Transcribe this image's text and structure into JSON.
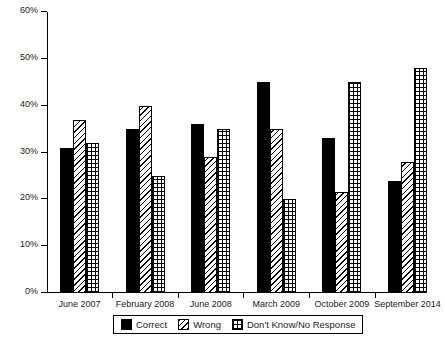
{
  "chart_data": {
    "type": "bar",
    "title": "",
    "subtitle": "",
    "xlabel": "",
    "ylabel": "",
    "ylim": [
      0,
      60
    ],
    "ytick_values": [
      0,
      10,
      20,
      30,
      40,
      50,
      60
    ],
    "ytick_labels": [
      "0%",
      "10%",
      "20%",
      "30%",
      "40%",
      "50%",
      "60%"
    ],
    "grid": false,
    "legend_position": "bottom",
    "categories": [
      "June 2007",
      "February 2008",
      "June 2008",
      "March 2009",
      "October 2009",
      "September 2014"
    ],
    "series": [
      {
        "name": "Correct",
        "pattern": "solid-black",
        "color": "#000000",
        "values": [
          31,
          35,
          36,
          45,
          33,
          24
        ]
      },
      {
        "name": "Wrong",
        "pattern": "diagonal-hatch",
        "color": "#ffffff",
        "values": [
          37,
          40,
          29,
          35,
          21.5,
          28
        ]
      },
      {
        "name": "Don't Know/No Response",
        "pattern": "cross-hatch",
        "color": "#ffffff",
        "values": [
          32,
          25,
          35,
          20,
          45,
          48
        ]
      }
    ]
  },
  "legend": {
    "items": [
      {
        "label": "Correct"
      },
      {
        "label": "Wrong"
      },
      {
        "label": "Don't Know/No Response"
      }
    ]
  }
}
